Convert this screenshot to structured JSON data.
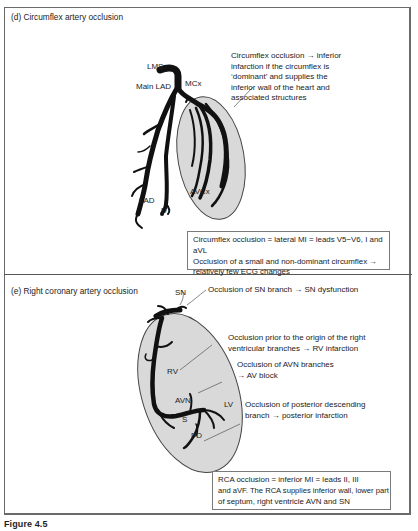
{
  "figure": {
    "caption": "Figure 4.5",
    "colors": {
      "heart_fill": "#d9d9d9",
      "artery": "#111111",
      "border": "#6a6a6a",
      "text": "#222222"
    }
  },
  "panel_d": {
    "title": "(d) Circumflex artery occlusion",
    "labels": {
      "lms": "LMS",
      "main_lad": "Main LAD",
      "mcx": "MCx",
      "lad": "LAD",
      "d": "D",
      "avcx": "AVCx"
    },
    "note_lines": [
      "Circumflex occlusion → inferior",
      "infarction if the circumflex is",
      "‘dominant’ and supplies the",
      "inferior wall of the heart and",
      "associated structures"
    ],
    "box_lines": [
      "Circumflex occlusion = lateral MI = leads V5−V6, I and aVL",
      "Occlusion of a small and non-dominant circumflex →",
      "relatively few ECG changes"
    ]
  },
  "panel_e": {
    "title": "(e) Right coronary artery occlusion",
    "labels": {
      "sn": "SN",
      "rv": "RV",
      "avn": "AVN",
      "lv": "LV",
      "s": "S",
      "pd": "PD"
    },
    "notes": {
      "sn": [
        "Occlusion of SN branch → SN dysfunction"
      ],
      "rv": [
        "Occlusion prior to the origin of the right",
        "ventricular branches → RV infarction"
      ],
      "avn": [
        "Occlusion of AVN branches",
        "→ AV block"
      ],
      "pd": [
        "Occlusion of posterior descending",
        "branch → posterior infarction"
      ]
    },
    "box_lines": [
      "RCA occlusion = inferior MI = leads II, III",
      "and aVF. The RCA supplies inferior wall, lower part",
      "of septum, right ventricle AVN and SN"
    ]
  }
}
